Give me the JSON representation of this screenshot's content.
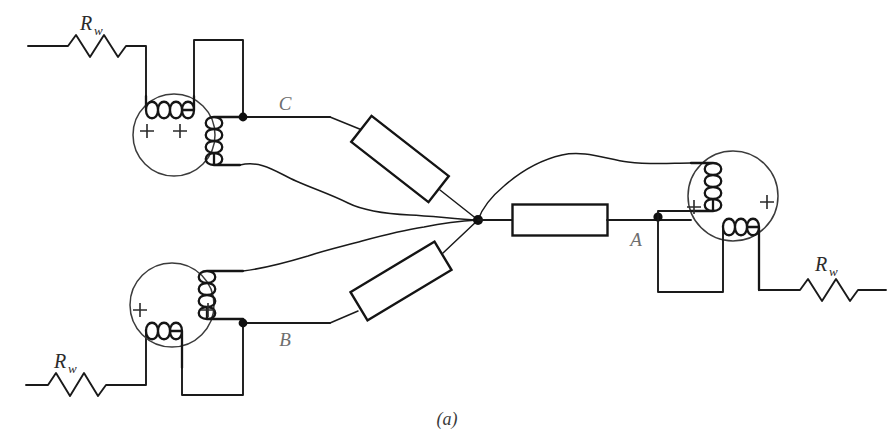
{
  "figure": {
    "caption": "(a)",
    "type": "three-phase transformer bank wiring diagram"
  },
  "terminals": [
    {
      "id": "C",
      "label": "C",
      "x": 285,
      "y": 103
    },
    {
      "id": "B",
      "label": "B",
      "x": 285,
      "y": 340
    },
    {
      "id": "A",
      "label": "A",
      "x": 636,
      "y": 241
    }
  ],
  "resistors": [
    {
      "id": "rw-top-left",
      "label": "R",
      "subscript": "w",
      "label_x": 86,
      "label_y": 30
    },
    {
      "id": "rw-bottom-left",
      "label": "R",
      "subscript": "w",
      "label_x": 58,
      "label_y": 366
    },
    {
      "id": "rw-right",
      "label": "R",
      "subscript": "w",
      "label_x": 820,
      "label_y": 269
    }
  ],
  "transformers": [
    {
      "id": "transformer-top-left",
      "cx": 174,
      "cy": 135,
      "r": 41,
      "polarity_marks": [
        {
          "x": 147,
          "y": 131
        },
        {
          "x": 180,
          "y": 131
        }
      ]
    },
    {
      "id": "transformer-bottom-left",
      "cx": 172,
      "cy": 305,
      "r": 42,
      "polarity_marks": [
        {
          "x": 140,
          "y": 310
        },
        {
          "x": 208,
          "y": 310
        }
      ]
    },
    {
      "id": "transformer-right",
      "cx": 733,
      "cy": 196,
      "r": 45,
      "polarity_marks": [
        {
          "x": 694,
          "y": 207
        },
        {
          "x": 767,
          "y": 202
        }
      ]
    }
  ],
  "blocks": [
    {
      "id": "block-center",
      "cx": 560,
      "cy": 220,
      "w": 95,
      "h": 31,
      "angle": 0
    },
    {
      "id": "block-upper-diagonal",
      "cx": 400,
      "cy": 159,
      "w": 98,
      "h": 33,
      "angle": 38
    },
    {
      "id": "block-lower-diagonal",
      "cx": 401,
      "cy": 281,
      "w": 98,
      "h": 33,
      "angle": -31
    }
  ],
  "junctions": [
    {
      "id": "junction-c",
      "x": 243,
      "y": 117
    },
    {
      "id": "junction-b",
      "x": 243,
      "y": 323
    },
    {
      "id": "junction-center",
      "x": 478,
      "y": 220
    },
    {
      "id": "junction-a",
      "x": 658,
      "y": 217
    }
  ],
  "colors": {
    "wire": "#1a1a1a",
    "core_outline": "#3b3b3b",
    "terminal_label": "#6e6e6e",
    "resistor_label": "#2b2b2b",
    "background": "#ffffff"
  }
}
